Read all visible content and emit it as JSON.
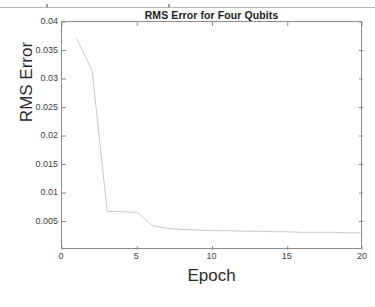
{
  "figure": {
    "title": "RMS Error for Four Qubits",
    "background_color": "#ffffff",
    "axis_color": "#8c8c8c",
    "line_color": "#c9c9c9"
  },
  "top_rule": {
    "visible": true,
    "color": "#b9b9b9"
  },
  "chart_data": {
    "type": "line",
    "title": "RMS Error for Four Qubits",
    "xlabel": "Epoch",
    "ylabel": "RMS Error",
    "xlim": [
      0,
      20
    ],
    "ylim": [
      0,
      0.04
    ],
    "grid": false,
    "legend": null,
    "xticks": [
      0,
      5,
      10,
      15,
      20
    ],
    "xticklabels": [
      "0",
      "5",
      "10",
      "15",
      "20"
    ],
    "yticks": [
      0.005,
      0.01,
      0.015,
      0.02,
      0.025,
      0.03,
      0.035,
      0.04
    ],
    "yticklabels": [
      "0.005",
      "0.01",
      "0.015",
      "0.02",
      "0.025",
      "0.03",
      "0.035",
      "0.04"
    ],
    "series": [
      {
        "name": "RMS Error",
        "color": "#c9c9c9",
        "x": [
          1,
          2,
          3,
          4,
          5,
          6,
          7,
          8,
          9,
          10,
          11,
          12,
          13,
          14,
          15,
          16,
          17,
          18,
          19,
          20
        ],
        "y": [
          0.037,
          0.0315,
          0.0068,
          0.0067,
          0.0066,
          0.0043,
          0.0038,
          0.0036,
          0.0035,
          0.0034,
          0.0034,
          0.0033,
          0.0033,
          0.0032,
          0.0032,
          0.0031,
          0.0031,
          0.0031,
          0.003,
          0.003
        ]
      }
    ]
  }
}
